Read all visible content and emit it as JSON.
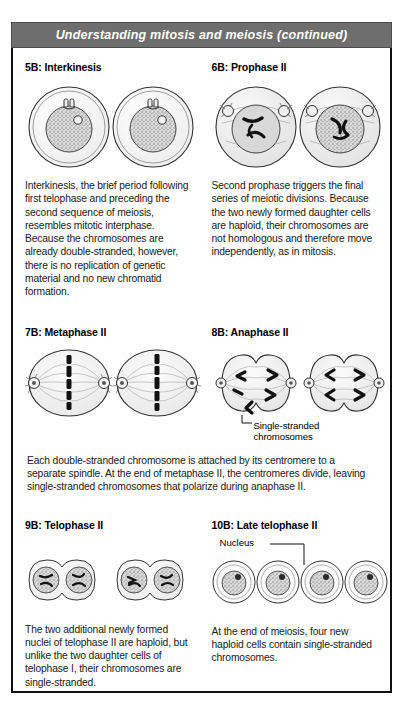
{
  "header": {
    "title": "Understanding mitosis and meiosis",
    "continued": "(continued)"
  },
  "panels": [
    {
      "id": "5B",
      "heading": "5B: Interkinesis",
      "figure": "two-round-cells-with-nucleus-and-centrioles",
      "body": "Interkinesis, the brief period following first telophase and preceding the second sequence of meiosis, resembles mitotic interphase. Because the chromosomes are already double-stranded, however, there is no replication of genetic material and no new chromatid formation."
    },
    {
      "id": "6B",
      "heading": "6B: Prophase II",
      "figure": "two-cells-with-condensed-chromosomes-and-poles",
      "body": "Second prophase triggers the final series of meiotic divisions. Because the two newly formed daughter cells are haploid, their chromosomes are not homologous and therefore move independently, as in mitosis."
    },
    {
      "id": "7B",
      "heading": "7B: Metaphase II",
      "figure": "two-oval-cells-with-equatorial-chromosome-plate",
      "body": ""
    },
    {
      "id": "8B",
      "heading": "8B: Anaphase II",
      "figure": "two-dumbbell-cells-with-migrating-chromosomes",
      "annotation": "Single-stranded chromosomes",
      "body": ""
    },
    {
      "id": "9B",
      "heading": "9B: Telophase II",
      "figure": "two-pairs-of-dividing-cells",
      "body": "The two additional newly formed nuclei of telophase II are haploid, but unlike the two daughter cells of telophase I, their chromosomes are single-stranded."
    },
    {
      "id": "10B",
      "heading": "10B: Late telophase II",
      "figure": "four-separate-haploid-cells",
      "annotation": "Nucleus",
      "body": "At the end of meiosis, four new haploid cells contain single-stranded chromosomes."
    }
  ],
  "shared_caption": "Each double-stranded chromosome is attached by its centromere to a separate spindle. At the end of metaphase II, the centromeres divide, leaving single-stranded chromosomes that polarize during anaphase II.",
  "colors": {
    "header_bar": "#6e6e6e",
    "header_text": "#ffffff",
    "border": "#111111",
    "body_text": "#1b1b1b",
    "page_background": "#fefefe"
  }
}
